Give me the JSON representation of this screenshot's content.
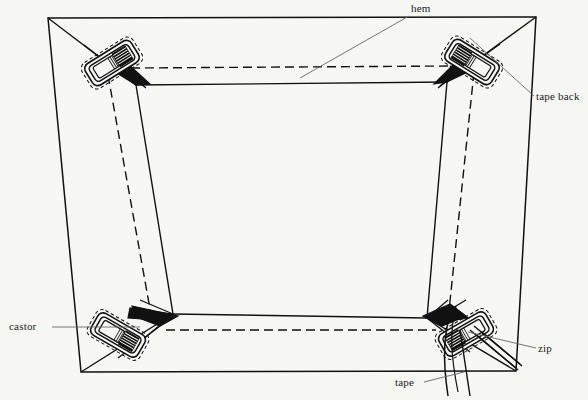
{
  "diagram": {
    "background_color": "#f7f7f4",
    "line_color": "#111111",
    "leader_color": "#555555",
    "labels": [
      {
        "id": "hem",
        "text": "hem",
        "x": 411,
        "y": 2,
        "leader_from": [
          409,
          15
        ],
        "leader_to": [
          300,
          78
        ]
      },
      {
        "id": "tape_back",
        "text": "tape back",
        "x": 536,
        "y": 90,
        "leader_from": [
          534,
          96
        ],
        "leader_to": [
          470,
          40
        ]
      },
      {
        "id": "castor",
        "text": "castor",
        "x": 9,
        "y": 320,
        "leader_from": [
          52,
          327
        ],
        "leader_to": [
          140,
          327
        ]
      },
      {
        "id": "zip",
        "text": "zip",
        "x": 538,
        "y": 342,
        "leader_from": [
          536,
          348
        ],
        "leader_to": [
          470,
          330
        ]
      },
      {
        "id": "tape",
        "text": "tape",
        "x": 395,
        "y": 376,
        "leader_from": [
          424,
          382
        ],
        "leader_to": [
          466,
          371
        ]
      }
    ],
    "outer_frame": {
      "name": "outer-panel-outline",
      "points": [
        [
          48,
          18
        ],
        [
          536,
          17
        ],
        [
          516,
          371
        ],
        [
          81,
          372
        ]
      ]
    },
    "inner_frame": {
      "name": "inner-top-panel-outline",
      "points": [
        [
          136,
          85
        ],
        [
          447,
          82
        ],
        [
          427,
          318
        ],
        [
          173,
          314
        ]
      ]
    },
    "corner_castors": [
      {
        "id": "castor-top-left",
        "cx": 112,
        "cy": 63,
        "rotation": -32
      },
      {
        "id": "castor-top-right",
        "cx": 472,
        "cy": 62,
        "rotation": 32
      },
      {
        "id": "castor-bottom-left",
        "cx": 118,
        "cy": 335,
        "rotation": 30
      },
      {
        "id": "castor-bottom-right",
        "cx": 466,
        "cy": 334,
        "rotation": -30
      }
    ],
    "zip_detail": {
      "id": "zip-tape-strips",
      "description": "double-line zip strips running to bottom-right corner"
    },
    "dashed_lines": {
      "description": "hidden edges shown as dashed: inner rear hem rectangle and vertical rear seams"
    }
  }
}
